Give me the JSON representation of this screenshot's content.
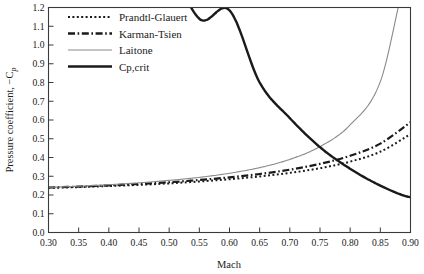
{
  "chart_data": {
    "type": "line",
    "title": "",
    "xlabel": "Mach",
    "ylabel": "Pressure coefficient,  −C",
    "ylabel_sub": "p",
    "xlim": [
      0.3,
      0.9
    ],
    "ylim": [
      0.0,
      1.2
    ],
    "grid": false,
    "legend_position": "top-left",
    "xticks": [
      "0.30",
      "0.35",
      "0.40",
      "0.45",
      "0.50",
      "0.55",
      "0.60",
      "0.65",
      "0.70",
      "0.75",
      "0.80",
      "0.85",
      "0.90"
    ],
    "xtick_values": [
      0.3,
      0.35,
      0.4,
      0.45,
      0.5,
      0.55,
      0.6,
      0.65,
      0.7,
      0.75,
      0.8,
      0.85,
      0.9
    ],
    "yticks": [
      "0.0",
      "0.1",
      "0.2",
      "0.3",
      "0.4",
      "0.5",
      "0.6",
      "0.7",
      "0.8",
      "0.9",
      "1.0",
      "1.1",
      "1.2"
    ],
    "ytick_values": [
      0.0,
      0.1,
      0.2,
      0.3,
      0.4,
      0.5,
      0.6,
      0.7,
      0.8,
      0.9,
      1.0,
      1.1,
      1.2
    ],
    "x": [
      0.3,
      0.35,
      0.4,
      0.45,
      0.5,
      0.55,
      0.6,
      0.65,
      0.7,
      0.75,
      0.8,
      0.85,
      0.9
    ],
    "series": [
      {
        "name": "Prandtl-Glauert",
        "style": "dotted",
        "color": "#1a1a1a",
        "width": 2.0,
        "values": [
          0.238,
          0.242,
          0.248,
          0.254,
          0.262,
          0.272,
          0.284,
          0.299,
          0.318,
          0.343,
          0.378,
          0.431,
          0.525
        ]
      },
      {
        "name": "Karman-Tsien",
        "style": "dash-dot",
        "color": "#1a1a1a",
        "width": 2.2,
        "values": [
          0.24,
          0.245,
          0.251,
          0.259,
          0.268,
          0.28,
          0.294,
          0.312,
          0.335,
          0.366,
          0.409,
          0.474,
          0.588
        ]
      },
      {
        "name": "Laitone",
        "style": "solid",
        "color": "#8a8a8a",
        "width": 1.1,
        "values": [
          0.241,
          0.247,
          0.255,
          0.265,
          0.278,
          0.294,
          0.316,
          0.346,
          0.39,
          0.458,
          0.574,
          0.805,
          1.43
        ]
      },
      {
        "name": "Cp,crit",
        "style": "solid",
        "color": "#1a1a1a",
        "width": 2.4,
        "values": [
          6.8,
          4.2,
          2.82,
          2.0,
          1.48,
          1.14,
          1.185,
          0.8,
          0.61,
          0.455,
          0.34,
          0.25,
          0.188
        ]
      }
    ],
    "legend": [
      {
        "label": "Prandtl-Glauert",
        "style": "dotted",
        "color": "#1a1a1a"
      },
      {
        "label": "Karman-Tsien",
        "style": "dash-dot",
        "color": "#1a1a1a"
      },
      {
        "label": "Laitone",
        "style": "solid",
        "color": "#8a8a8a"
      },
      {
        "label": "Cp,crit",
        "style": "solid-thick",
        "color": "#1a1a1a"
      }
    ]
  }
}
